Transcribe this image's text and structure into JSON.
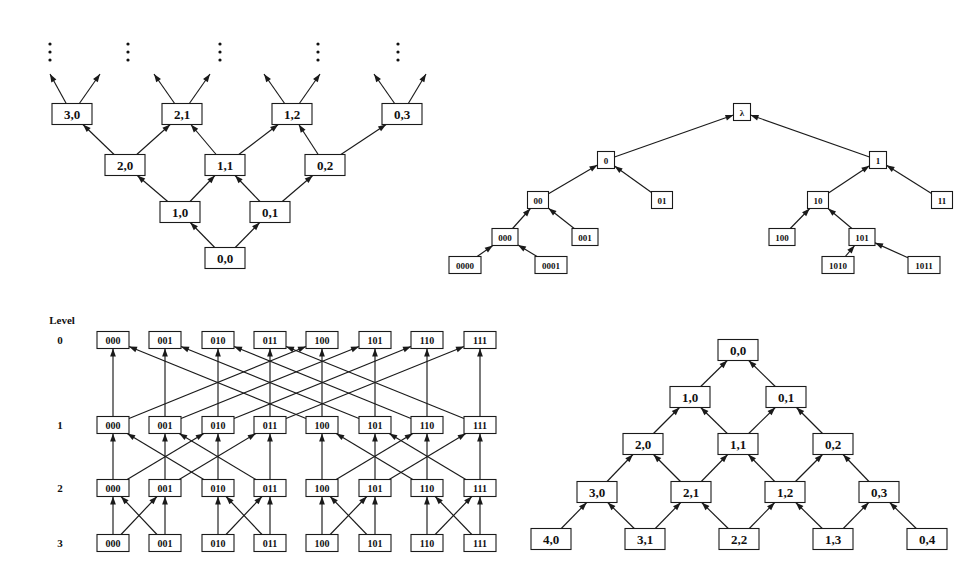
{
  "page": {
    "background_color": "#ffffff",
    "ink_color": "#1a1a1a",
    "width": 980,
    "height": 569
  },
  "figures": [
    {
      "id": "infinite-diamond-lattice",
      "name": "infinite-upward-lattice",
      "caption": "",
      "origin": {
        "x": 0,
        "y": 0
      },
      "node_style": {
        "w": 40,
        "h": 21,
        "font_size": 13
      },
      "nodes": [
        {
          "id": "tl-0-0",
          "label": "0,0",
          "x": 225,
          "y": 258
        },
        {
          "id": "tl-1-0",
          "label": "1,0",
          "x": 180,
          "y": 212
        },
        {
          "id": "tl-0-1",
          "label": "0,1",
          "x": 270,
          "y": 212
        },
        {
          "id": "tl-2-0",
          "label": "2,0",
          "x": 125,
          "y": 165
        },
        {
          "id": "tl-1-1",
          "label": "1,1",
          "x": 225,
          "y": 165
        },
        {
          "id": "tl-0-2",
          "label": "0,2",
          "x": 325,
          "y": 165
        },
        {
          "id": "tl-3-0",
          "label": "3,0",
          "x": 72,
          "y": 114
        },
        {
          "id": "tl-2-1",
          "label": "2,1",
          "x": 182,
          "y": 114
        },
        {
          "id": "tl-1-2",
          "label": "1,2",
          "x": 292,
          "y": 114
        },
        {
          "id": "tl-0-3",
          "label": "0,3",
          "x": 402,
          "y": 114
        }
      ],
      "edges": [
        {
          "from": "tl-0-0",
          "to": "tl-1-0"
        },
        {
          "from": "tl-0-0",
          "to": "tl-0-1"
        },
        {
          "from": "tl-1-0",
          "to": "tl-2-0"
        },
        {
          "from": "tl-1-0",
          "to": "tl-1-1"
        },
        {
          "from": "tl-0-1",
          "to": "tl-1-1"
        },
        {
          "from": "tl-0-1",
          "to": "tl-0-2"
        },
        {
          "from": "tl-2-0",
          "to": "tl-3-0"
        },
        {
          "from": "tl-2-0",
          "to": "tl-2-1"
        },
        {
          "from": "tl-1-1",
          "to": "tl-2-1"
        },
        {
          "from": "tl-1-1",
          "to": "tl-1-2"
        },
        {
          "from": "tl-0-2",
          "to": "tl-1-2"
        },
        {
          "from": "tl-0-2",
          "to": "tl-0-3"
        }
      ],
      "open_edges": [
        {
          "from": "tl-3-0",
          "dx": -22,
          "dy": -40
        },
        {
          "from": "tl-3-0",
          "dx": 28,
          "dy": -40
        },
        {
          "from": "tl-2-1",
          "dx": -28,
          "dy": -40
        },
        {
          "from": "tl-2-1",
          "dx": 28,
          "dy": -40
        },
        {
          "from": "tl-1-2",
          "dx": -28,
          "dy": -40
        },
        {
          "from": "tl-1-2",
          "dx": 28,
          "dy": -40
        },
        {
          "from": "tl-0-3",
          "dx": -28,
          "dy": -40
        },
        {
          "from": "tl-0-3",
          "dx": 24,
          "dy": -40
        }
      ],
      "ellipses": [
        {
          "x": 50,
          "y": 44
        },
        {
          "x": 128,
          "y": 44
        },
        {
          "x": 220,
          "y": 44
        },
        {
          "x": 318,
          "y": 44
        },
        {
          "x": 398,
          "y": 44
        }
      ]
    },
    {
      "id": "binary-prefix-tree",
      "name": "binary-string-tree",
      "caption": "",
      "origin": {
        "x": 0,
        "y": 0
      },
      "node_style": {
        "w": 22,
        "h": 17,
        "font_size": 9
      },
      "nodes": [
        {
          "id": "tr-root",
          "label": "λ",
          "x": 742,
          "y": 112,
          "w": 17
        },
        {
          "id": "tr-0",
          "label": "0",
          "x": 606,
          "y": 160,
          "w": 17
        },
        {
          "id": "tr-1",
          "label": "1",
          "x": 878,
          "y": 160,
          "w": 17
        },
        {
          "id": "tr-00",
          "label": "00",
          "x": 538,
          "y": 200,
          "w": 21
        },
        {
          "id": "tr-01",
          "label": "01",
          "x": 662,
          "y": 200,
          "w": 21
        },
        {
          "id": "tr-10",
          "label": "10",
          "x": 818,
          "y": 200,
          "w": 21
        },
        {
          "id": "tr-11",
          "label": "11",
          "x": 942,
          "y": 200,
          "w": 21
        },
        {
          "id": "tr-000",
          "label": "000",
          "x": 505,
          "y": 237,
          "w": 26
        },
        {
          "id": "tr-001",
          "label": "001",
          "x": 585,
          "y": 237,
          "w": 26
        },
        {
          "id": "tr-100",
          "label": "100",
          "x": 782,
          "y": 237,
          "w": 26
        },
        {
          "id": "tr-101",
          "label": "101",
          "x": 862,
          "y": 237,
          "w": 26
        },
        {
          "id": "tr-0000",
          "label": "0000",
          "x": 465,
          "y": 265,
          "w": 32
        },
        {
          "id": "tr-0001",
          "label": "0001",
          "x": 551,
          "y": 265,
          "w": 32
        },
        {
          "id": "tr-1010",
          "label": "1010",
          "x": 838,
          "y": 265,
          "w": 32
        },
        {
          "id": "tr-1011",
          "label": "1011",
          "x": 924,
          "y": 265,
          "w": 32
        }
      ],
      "edges": [
        {
          "from": "tr-0",
          "to": "tr-root"
        },
        {
          "from": "tr-1",
          "to": "tr-root"
        },
        {
          "from": "tr-00",
          "to": "tr-0"
        },
        {
          "from": "tr-01",
          "to": "tr-0"
        },
        {
          "from": "tr-10",
          "to": "tr-1"
        },
        {
          "from": "tr-11",
          "to": "tr-1"
        },
        {
          "from": "tr-000",
          "to": "tr-00"
        },
        {
          "from": "tr-001",
          "to": "tr-00"
        },
        {
          "from": "tr-100",
          "to": "tr-10"
        },
        {
          "from": "tr-101",
          "to": "tr-10"
        },
        {
          "from": "tr-0000",
          "to": "tr-000"
        },
        {
          "from": "tr-0001",
          "to": "tr-000"
        },
        {
          "from": "tr-1010",
          "to": "tr-101"
        },
        {
          "from": "tr-1011",
          "to": "tr-101"
        }
      ]
    },
    {
      "id": "butterfly-network",
      "name": "butterfly-network",
      "caption": "Level",
      "caption_pos": {
        "x": 62,
        "y": 320
      },
      "node_style": {
        "w": 32,
        "h": 17,
        "font_size": 10
      },
      "level_labels": [
        {
          "label": "0",
          "x": 60,
          "y": 340
        },
        {
          "label": "1",
          "x": 60,
          "y": 425
        },
        {
          "label": "2",
          "x": 60,
          "y": 488
        },
        {
          "label": "3",
          "x": 60,
          "y": 543
        }
      ],
      "column_x": [
        113,
        165,
        218,
        270,
        322,
        375,
        427,
        480
      ],
      "row_y": [
        340,
        425,
        488,
        543
      ],
      "node_labels": [
        "000",
        "001",
        "010",
        "011",
        "100",
        "101",
        "110",
        "111"
      ],
      "stages": [
        {
          "from_row": 3,
          "to_row": 2,
          "bit_span": 1
        },
        {
          "from_row": 2,
          "to_row": 1,
          "bit_span": 2
        },
        {
          "from_row": 1,
          "to_row": 0,
          "bit_span": 4
        }
      ]
    },
    {
      "id": "finite-diamond-lattice",
      "name": "finite-downward-lattice",
      "caption": "",
      "node_style": {
        "w": 40,
        "h": 21,
        "font_size": 13
      },
      "nodes": [
        {
          "id": "br-0-0",
          "label": "0,0",
          "x": 738,
          "y": 350
        },
        {
          "id": "br-1-0",
          "label": "1,0",
          "x": 690,
          "y": 397
        },
        {
          "id": "br-0-1",
          "label": "0,1",
          "x": 786,
          "y": 397
        },
        {
          "id": "br-2-0",
          "label": "2,0",
          "x": 643,
          "y": 444
        },
        {
          "id": "br-1-1",
          "label": "1,1",
          "x": 738,
          "y": 444
        },
        {
          "id": "br-0-2",
          "label": "0,2",
          "x": 833,
          "y": 444
        },
        {
          "id": "br-3-0",
          "label": "3,0",
          "x": 597,
          "y": 492
        },
        {
          "id": "br-2-1",
          "label": "2,1",
          "x": 691,
          "y": 492
        },
        {
          "id": "br-1-2",
          "label": "1,2",
          "x": 785,
          "y": 492
        },
        {
          "id": "br-0-3",
          "label": "0,3",
          "x": 879,
          "y": 492
        },
        {
          "id": "br-4-0",
          "label": "4,0",
          "x": 551,
          "y": 539
        },
        {
          "id": "br-3-1",
          "label": "3,1",
          "x": 645,
          "y": 539
        },
        {
          "id": "br-2-2",
          "label": "2,2",
          "x": 739,
          "y": 539
        },
        {
          "id": "br-1-3",
          "label": "1,3",
          "x": 833,
          "y": 539
        },
        {
          "id": "br-0-4",
          "label": "0,4",
          "x": 927,
          "y": 539
        }
      ],
      "edges": [
        {
          "from": "br-1-0",
          "to": "br-0-0"
        },
        {
          "from": "br-0-1",
          "to": "br-0-0"
        },
        {
          "from": "br-2-0",
          "to": "br-1-0"
        },
        {
          "from": "br-1-1",
          "to": "br-1-0"
        },
        {
          "from": "br-1-1",
          "to": "br-0-1"
        },
        {
          "from": "br-0-2",
          "to": "br-0-1"
        },
        {
          "from": "br-3-0",
          "to": "br-2-0"
        },
        {
          "from": "br-2-1",
          "to": "br-2-0"
        },
        {
          "from": "br-2-1",
          "to": "br-1-1"
        },
        {
          "from": "br-1-2",
          "to": "br-1-1"
        },
        {
          "from": "br-1-2",
          "to": "br-0-2"
        },
        {
          "from": "br-0-3",
          "to": "br-0-2"
        },
        {
          "from": "br-4-0",
          "to": "br-3-0"
        },
        {
          "from": "br-3-1",
          "to": "br-3-0"
        },
        {
          "from": "br-3-1",
          "to": "br-2-1"
        },
        {
          "from": "br-2-2",
          "to": "br-2-1"
        },
        {
          "from": "br-2-2",
          "to": "br-1-2"
        },
        {
          "from": "br-1-3",
          "to": "br-1-2"
        },
        {
          "from": "br-1-3",
          "to": "br-0-3"
        },
        {
          "from": "br-0-4",
          "to": "br-0-3"
        }
      ]
    }
  ]
}
